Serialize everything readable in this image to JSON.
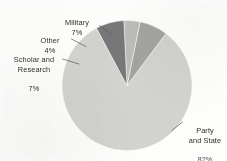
{
  "chart_data": {
    "type": "pie",
    "title": "",
    "subtitle": "",
    "xlabel": "",
    "ylabel": "",
    "legend_position": "none",
    "grid": false,
    "unit": "%",
    "categories": [
      "Party and State",
      "Military",
      "Other",
      "Scholar and Research"
    ],
    "values": [
      82,
      7,
      4,
      7
    ],
    "slices": [
      {
        "name": "Party and State",
        "value": 82,
        "value_text": "82%",
        "label_line1": "Party",
        "label_line2": "and State",
        "color": "#d2d2ce",
        "start_angle": 81,
        "end_angle": 376.2
      },
      {
        "name": "Military",
        "value": 7,
        "value_text": "7%",
        "label_line1": "Military",
        "label_line2": "",
        "color": "#a3a39f",
        "start_angle": 55.8,
        "end_angle": 81
      },
      {
        "name": "Other",
        "value": 4,
        "value_text": "4%",
        "label_line1": "Other",
        "label_line2": "",
        "color": "#bcbcb8",
        "start_angle": 41.4,
        "end_angle": 55.8
      },
      {
        "name": "Scholar and Research",
        "value": 7,
        "value_text": "7%",
        "label_line1": "Scholar and",
        "label_line2": "Research",
        "color": "#77777a",
        "start_angle": 16.2,
        "end_angle": 41.4
      }
    ],
    "colors": {
      "party_and_state": "#d2d2ce",
      "military": "#a3a39f",
      "other": "#bcbcb8",
      "scholar_and_research": "#77777a",
      "background": "#fdfdfc",
      "label_text": "#2e2e2c",
      "leader_line": "#5a5a58"
    }
  }
}
